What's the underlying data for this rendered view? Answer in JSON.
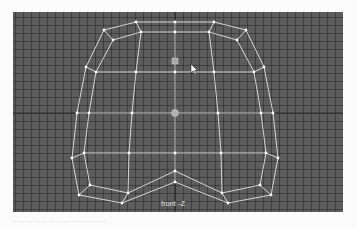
{
  "app": {
    "panel": "modeling viewport"
  },
  "viewport": {
    "camera_label": "front -Z",
    "background_color": "#5c5c5c",
    "grid_color": "#3a3a3a",
    "wire_color": "#e8e8e8",
    "axis_lines": {
      "horizontal_y": 101,
      "vertical_x": 162
    }
  },
  "mesh": {
    "edges_color": "#e4e4e4",
    "vertex_color": "#ffffff",
    "manipulators": [
      {
        "name": "selected-component-handle",
        "x": 162,
        "y": 49
      },
      {
        "name": "pivot-handle",
        "x": 162,
        "y": 101
      }
    ]
  },
  "cursor": {
    "x": 178,
    "y": 52
  },
  "caption": {
    "text": "— — — — — — — — — — — — —"
  }
}
